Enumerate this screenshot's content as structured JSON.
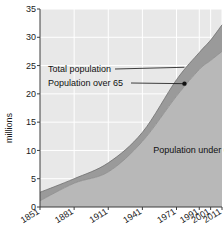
{
  "chart_data": {
    "type": "area",
    "title": "",
    "subtitle": "",
    "xlabel": "",
    "ylabel": "millions",
    "ylim": [
      0,
      35
    ],
    "yticks": [
      0,
      5,
      10,
      15,
      20,
      25,
      30,
      35
    ],
    "ytick_labels": [
      "0",
      "5",
      "10",
      "15",
      "20",
      "25",
      "30",
      "35"
    ],
    "categories": [
      "1851",
      "1881",
      "1911",
      "1941",
      "1971",
      "1991",
      "2001",
      "2011"
    ],
    "x": [
      1851,
      1881,
      1911,
      1941,
      1971,
      1991,
      2001,
      2011
    ],
    "grid": true,
    "legend_position": "none",
    "series": [
      {
        "name": "Total population",
        "values": [
          2.6,
          5.0,
          7.8,
          13.2,
          22.5,
          27.3,
          29.5,
          32.2
        ],
        "color": "#9a9a9a"
      },
      {
        "name": "Population under 65",
        "values": [
          1.1,
          4.2,
          6.2,
          11.6,
          19.6,
          24.3,
          25.9,
          27.5
        ],
        "color": "#b7b7b7"
      }
    ],
    "annotations": [
      {
        "name": "total-population",
        "label": "Total population",
        "target_x": 1978,
        "target_y": 24.7
      },
      {
        "name": "population-over-65",
        "label": "Population over 65",
        "target_x": 1978,
        "target_y": 21.8,
        "marker": true
      },
      {
        "name": "population-under-65",
        "label": "Population under 65",
        "target_x": 1986,
        "target_y": 9.6
      }
    ],
    "colors": {
      "band_over65": "#9a9a9a",
      "band_under65": "#b8b8b8",
      "plot_background": "#e8e8e8",
      "gridline": "#ffffff",
      "axis": "#4a4a4a",
      "text": "#1a1a1a"
    }
  }
}
